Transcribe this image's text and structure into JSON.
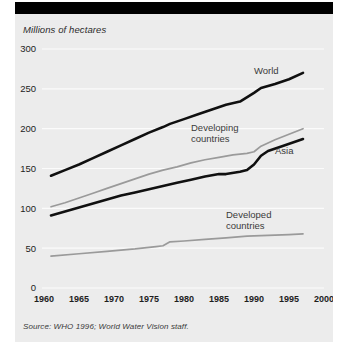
{
  "figure": {
    "axis_title": "Millions of hectares",
    "source_note": "Source: WHO 1996; World Water Vision staff.",
    "background_color": "#ececec",
    "header_bar_color": "#000000",
    "gridline_color": "#fbfbfb"
  },
  "chart_data": {
    "type": "line",
    "title": "Millions of hectares",
    "xlabel": "",
    "ylabel": "Millions of hectares",
    "xlim": [
      1960,
      2000
    ],
    "ylim": [
      0,
      300
    ],
    "xticks": [
      1960,
      1965,
      1970,
      1975,
      1980,
      1985,
      1990,
      1995,
      2000
    ],
    "yticks": [
      0,
      50,
      100,
      150,
      200,
      250,
      300
    ],
    "grid": "horizontal",
    "legend": "inline-annotations",
    "series": [
      {
        "name": "World",
        "color": "#101010",
        "style": "thick-black",
        "label_x": 1990,
        "label_y": 268,
        "x": [
          1961,
          1963,
          1965,
          1967,
          1969,
          1971,
          1973,
          1975,
          1977,
          1978,
          1980,
          1982,
          1984,
          1986,
          1988,
          1990,
          1991,
          1993,
          1995,
          1997
        ],
        "values": [
          141,
          148,
          155,
          163,
          171,
          179,
          187,
          195,
          202,
          206,
          212,
          218,
          224,
          230,
          234,
          245,
          251,
          256,
          262,
          270
        ]
      },
      {
        "name": "Developing countries",
        "color": "#9a9a9a",
        "style": "thin-gray",
        "label_x": 1981,
        "label_y": 197,
        "x": [
          1961,
          1963,
          1965,
          1967,
          1969,
          1971,
          1973,
          1975,
          1977,
          1979,
          1981,
          1983,
          1985,
          1987,
          1989,
          1990,
          1991,
          1993,
          1995,
          1997
        ],
        "values": [
          102,
          107,
          113,
          119,
          125,
          131,
          137,
          143,
          148,
          152,
          157,
          161,
          164,
          167,
          169,
          171,
          178,
          186,
          193,
          200
        ]
      },
      {
        "name": "Asia",
        "color": "#101010",
        "style": "thick-black",
        "label_x": 1993,
        "label_y": 168,
        "x": [
          1961,
          1963,
          1965,
          1967,
          1969,
          1971,
          1973,
          1975,
          1977,
          1979,
          1981,
          1983,
          1985,
          1986,
          1988,
          1989,
          1990,
          1991,
          1992,
          1994,
          1997
        ],
        "values": [
          91,
          96,
          101,
          106,
          111,
          116,
          120,
          124,
          128,
          132,
          136,
          140,
          143,
          143,
          146,
          148,
          155,
          166,
          172,
          178,
          187
        ]
      },
      {
        "name": "Developed countries",
        "color": "#9a9a9a",
        "style": "thin-gray",
        "label_x": 1986,
        "label_y": 88,
        "x": [
          1961,
          1965,
          1969,
          1973,
          1976,
          1977,
          1978,
          1980,
          1983,
          1986,
          1989,
          1992,
          1995,
          1997
        ],
        "values": [
          40,
          43,
          46,
          49,
          52,
          53,
          58,
          59,
          61,
          63,
          65,
          66,
          67,
          68
        ]
      }
    ]
  }
}
